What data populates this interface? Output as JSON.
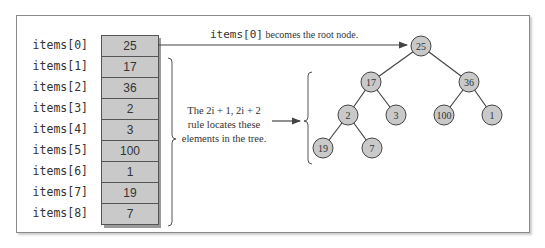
{
  "array": {
    "labels": [
      "items[0]",
      "items[1]",
      "items[2]",
      "items[3]",
      "items[4]",
      "items[5]",
      "items[6]",
      "items[7]",
      "items[8]"
    ],
    "values": [
      "25",
      "17",
      "36",
      "2",
      "3",
      "100",
      "1",
      "19",
      "7"
    ]
  },
  "captions": {
    "root_mono": "items[0]",
    "root_text": " becomes the root node.",
    "rule_line1": "The 2i + 1, 2i + 2",
    "rule_line2": "rule locates these",
    "rule_line3": "elements in the tree."
  },
  "tree": {
    "nodes": [
      {
        "value": "25",
        "x": 421,
        "y": 46
      },
      {
        "value": "17",
        "x": 371,
        "y": 82
      },
      {
        "value": "36",
        "x": 469,
        "y": 82
      },
      {
        "value": "2",
        "x": 348,
        "y": 115
      },
      {
        "value": "3",
        "x": 396,
        "y": 115
      },
      {
        "value": "100",
        "x": 444,
        "y": 115
      },
      {
        "value": "1",
        "x": 492,
        "y": 115
      },
      {
        "value": "19",
        "x": 323,
        "y": 148
      },
      {
        "value": "7",
        "x": 372,
        "y": 148
      }
    ]
  },
  "colors": {
    "node_fill": "#c9c9c9",
    "cell_fill": "#c9c9c9",
    "stroke": "#444444"
  }
}
